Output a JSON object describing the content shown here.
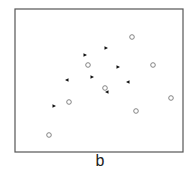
{
  "panel_label": "b",
  "frame": {
    "x": 15,
    "y": 9,
    "width": 168,
    "height": 143,
    "stroke": "#555555"
  },
  "colors": {
    "circle_stroke": "#777777",
    "triangle_fill": "#111111"
  },
  "chart_data": {
    "type": "scatter",
    "title": "",
    "xlabel": "",
    "ylabel": "",
    "grid": false,
    "axes_ticks": false,
    "series": [
      {
        "name": "open-circles",
        "marker": "circle-open",
        "points": [
          [
            132,
            37
          ],
          [
            88,
            65
          ],
          [
            153,
            65
          ],
          [
            105,
            88
          ],
          [
            69,
            102
          ],
          [
            171,
            98
          ],
          [
            136,
            111
          ],
          [
            49,
            135
          ]
        ]
      },
      {
        "name": "right-triangles",
        "marker": "triangle-right-filled",
        "points": [
          [
            85,
            55
          ],
          [
            106,
            48
          ],
          [
            118,
            67
          ],
          [
            92,
            77
          ],
          [
            54,
            106
          ]
        ]
      },
      {
        "name": "left-triangles",
        "marker": "triangle-left-filled",
        "points": [
          [
            67,
            80
          ],
          [
            128,
            82
          ],
          [
            107,
            92
          ]
        ]
      }
    ],
    "annotations": [
      "b"
    ]
  }
}
